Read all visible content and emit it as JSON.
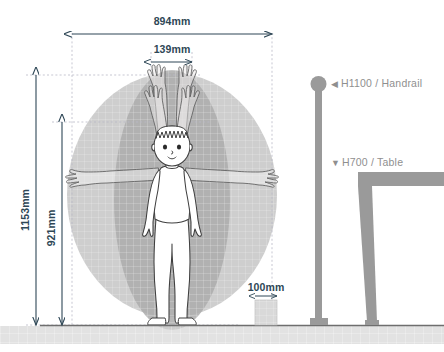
{
  "diagram": {
    "units": "mm"
  },
  "dimensions": {
    "span_width": {
      "label": "894mm",
      "value": 894,
      "orientation": "horizontal",
      "description": "full lateral arm-span reach width"
    },
    "inner_width": {
      "label": "139mm",
      "value": 139,
      "orientation": "horizontal",
      "description": "shoulder/hand separation at overhead reach"
    },
    "max_height": {
      "label": "1153mm",
      "value": 1153,
      "orientation": "vertical",
      "description": "maximum overhead reach height"
    },
    "mid_height": {
      "label": "921mm",
      "value": 921,
      "orientation": "vertical",
      "description": "secondary reach height"
    },
    "step_width": {
      "label": "100mm",
      "value": 100,
      "orientation": "horizontal",
      "description": "small block width"
    }
  },
  "annotations": [
    {
      "marker": "◀",
      "marker_name": "triangle-left-icon",
      "label": "H1100 / Handrail",
      "height": 1100,
      "element": "Handrail"
    },
    {
      "marker": "▼",
      "marker_name": "triangle-down-icon",
      "label": "H700 / Table",
      "height": 700,
      "element": "Table"
    }
  ],
  "colors": {
    "dimension_line": "#2e4756",
    "annotation_text": "#8f8f8f",
    "furniture_gray": "#9a9a9a",
    "envelope_outer": "#cfcfcf",
    "envelope_inner": "#b0b0b0",
    "figure_outline": "#4a4a4a",
    "ground_line": "#6e6e6e",
    "guide_dash": "#b8b8c4",
    "background": "#ffffff"
  },
  "figure": {
    "name": "standing child",
    "poses": [
      "arms raised overhead",
      "arms extended horizontally",
      "arms at sides"
    ]
  }
}
